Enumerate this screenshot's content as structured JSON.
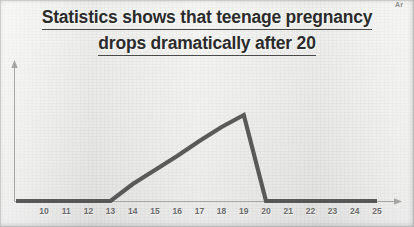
{
  "chart_data": {
    "type": "line",
    "title": "Statistics shows that teenage pregnancy drops dramatically after 20",
    "title_lines": [
      "Statistics shows that teenage pregnancy",
      "drops dramatically after 20"
    ],
    "xlabel": "Ar",
    "ylabel": "",
    "grid": false,
    "legend": null,
    "xlim": [
      10,
      25
    ],
    "ylim": [
      0,
      100
    ],
    "xticks": [
      10,
      11,
      12,
      13,
      14,
      15,
      16,
      17,
      18,
      19,
      20,
      21,
      22,
      23,
      24,
      25
    ],
    "xtick_labels": [
      "10",
      "11",
      "12",
      "13",
      "14",
      "15",
      "16",
      "17",
      "18",
      "19",
      "20",
      "21",
      "22",
      "23",
      "24",
      "25"
    ],
    "yticks": [],
    "ytick_labels": [],
    "series": [
      {
        "name": "teenage pregnancy rate",
        "x": [
          10,
          11,
          12,
          13,
          14,
          15,
          16,
          17,
          18,
          19,
          20,
          21,
          22,
          23,
          24,
          25
        ],
        "values": [
          0,
          0,
          0,
          0,
          17,
          31,
          45,
          60,
          74,
          86,
          0,
          0,
          0,
          0,
          0,
          0
        ]
      }
    ],
    "annotations": [
      "flat at zero from 10 to 13",
      "rises steadily from 13 to peak at 19",
      "drops vertically to zero at 20",
      "flat at zero from 20 to 25"
    ]
  },
  "colors": {
    "line": "#4d4d4d",
    "axis": "#a6a6a4",
    "title_text": "#2b2b2b",
    "tick_text": "#6b6b6b",
    "background": "#e9e9e7"
  }
}
